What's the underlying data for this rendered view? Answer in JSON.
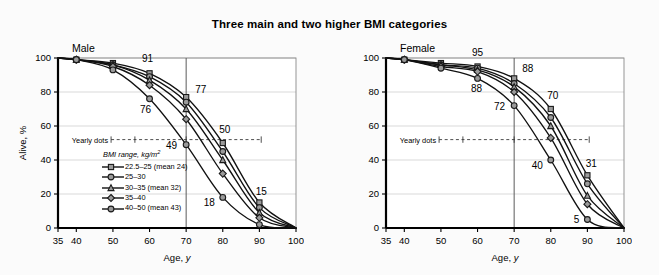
{
  "title": "Three main and two higher BMI categories",
  "colors": {
    "background": "#fbfbfb",
    "plot_background": "#ffffff",
    "axis": "#000000",
    "grid": "#cfcfcf",
    "marker_fill": "#9a9a9a",
    "marker_edge": "#1a1a1a",
    "line": "#111111",
    "reference_line": "#5a5a5a"
  },
  "legend": {
    "title": "BMI range, kg/m",
    "title_sup": "2",
    "items": [
      {
        "label": "22.5–25 (mean 24)",
        "marker": "square",
        "name": "legend-marker-22.5-25"
      },
      {
        "label": "25–30",
        "marker": "circle",
        "name": "legend-marker-25-30"
      },
      {
        "label": "30–35 (mean 32)",
        "marker": "triangle",
        "name": "legend-marker-30-35"
      },
      {
        "label": "35–40",
        "marker": "diamond",
        "name": "legend-marker-35-40"
      },
      {
        "label": "40–50 (mean 43)",
        "marker": "circle",
        "name": "legend-marker-40-50"
      }
    ]
  },
  "annotations": {
    "yearly_dots": "Yearly dots"
  },
  "chart_data": [
    {
      "type": "line",
      "panel": "left",
      "title": "Male",
      "xlabel": "Age, y",
      "ylabel": "Alive, %",
      "xlim": [
        35,
        100
      ],
      "ylim": [
        0,
        100
      ],
      "xticks": [
        35,
        40,
        50,
        60,
        70,
        80,
        90,
        100
      ],
      "yticks": [
        0,
        20,
        40,
        60,
        80,
        100
      ],
      "grid": "horizontal",
      "legend_position": "inside-lower-left",
      "reference_line_x": 70,
      "x": [
        35,
        40,
        50,
        60,
        70,
        80,
        90,
        100
      ],
      "series": [
        {
          "name": "22.5–25 (mean 24)",
          "marker": "square",
          "values": [
            100,
            99,
            97,
            91,
            77,
            50,
            15,
            0
          ]
        },
        {
          "name": "25–30",
          "marker": "circle",
          "values": [
            100,
            99,
            96,
            89,
            74,
            45,
            12,
            0
          ]
        },
        {
          "name": "30–35 (mean 32)",
          "marker": "triangle",
          "values": [
            100,
            99,
            96,
            87,
            70,
            40,
            9,
            0
          ]
        },
        {
          "name": "35–40",
          "marker": "diamond",
          "values": [
            100,
            99,
            95,
            84,
            64,
            32,
            6,
            0
          ]
        },
        {
          "name": "40–50 (mean 43)",
          "marker": "circle",
          "values": [
            100,
            99,
            93,
            76,
            49,
            18,
            2,
            0
          ]
        }
      ],
      "point_labels": [
        {
          "text": "91",
          "x": 60,
          "y": 91,
          "dx": -2,
          "dy": -11,
          "anchor": "middle"
        },
        {
          "text": "76",
          "x": 60,
          "y": 76,
          "dx": -4,
          "dy": 14,
          "anchor": "middle"
        },
        {
          "text": "77",
          "x": 70,
          "y": 77,
          "dx": 9,
          "dy": -4,
          "anchor": "start"
        },
        {
          "text": "49",
          "x": 70,
          "y": 49,
          "dx": -9,
          "dy": 4,
          "anchor": "end"
        },
        {
          "text": "50",
          "x": 80,
          "y": 50,
          "dx": 2,
          "dy": -10,
          "anchor": "middle"
        },
        {
          "text": "18",
          "x": 80,
          "y": 18,
          "dx": -8,
          "dy": 9,
          "anchor": "end"
        },
        {
          "text": "15",
          "x": 90,
          "y": 15,
          "dx": 2,
          "dy": -8,
          "anchor": "middle"
        }
      ]
    },
    {
      "type": "line",
      "panel": "right",
      "title": "Female",
      "xlabel": "Age, y",
      "ylabel": "",
      "xlim": [
        35,
        100
      ],
      "ylim": [
        0,
        100
      ],
      "xticks": [
        35,
        40,
        50,
        60,
        70,
        80,
        90,
        100
      ],
      "yticks": [
        0,
        20,
        40,
        60,
        80,
        100
      ],
      "grid": "horizontal",
      "legend_position": "none",
      "reference_line_x": 70,
      "x": [
        35,
        40,
        50,
        60,
        70,
        80,
        90,
        100
      ],
      "series": [
        {
          "name": "22.5–25 (mean 24)",
          "marker": "square",
          "values": [
            100,
            99,
            97,
            95,
            88,
            70,
            31,
            0
          ]
        },
        {
          "name": "25–30",
          "marker": "circle",
          "values": [
            100,
            99,
            96,
            94,
            85,
            65,
            26,
            0
          ]
        },
        {
          "name": "30–35 (mean 32)",
          "marker": "triangle",
          "values": [
            100,
            99,
            96,
            93,
            83,
            60,
            19,
            0
          ]
        },
        {
          "name": "35–40",
          "marker": "diamond",
          "values": [
            100,
            99,
            95,
            92,
            80,
            53,
            14,
            0
          ]
        },
        {
          "name": "40–50 (mean 43)",
          "marker": "circle",
          "values": [
            100,
            99,
            94,
            88,
            72,
            40,
            5,
            0
          ]
        }
      ],
      "point_labels": [
        {
          "text": "95",
          "x": 60,
          "y": 95,
          "dx": 0,
          "dy": -11,
          "anchor": "middle"
        },
        {
          "text": "88",
          "x": 60,
          "y": 88,
          "dx": -1,
          "dy": 14,
          "anchor": "middle"
        },
        {
          "text": "88",
          "x": 70,
          "y": 88,
          "dx": 8,
          "dy": -6,
          "anchor": "start"
        },
        {
          "text": "72",
          "x": 70,
          "y": 72,
          "dx": -9,
          "dy": 4,
          "anchor": "end"
        },
        {
          "text": "70",
          "x": 80,
          "y": 70,
          "dx": 2,
          "dy": -10,
          "anchor": "middle"
        },
        {
          "text": "40",
          "x": 80,
          "y": 40,
          "dx": -8,
          "dy": 9,
          "anchor": "end"
        },
        {
          "text": "31",
          "x": 90,
          "y": 31,
          "dx": 4,
          "dy": -8,
          "anchor": "middle"
        },
        {
          "text": "5",
          "x": 90,
          "y": 5,
          "dx": -8,
          "dy": 3,
          "anchor": "end"
        }
      ]
    }
  ]
}
